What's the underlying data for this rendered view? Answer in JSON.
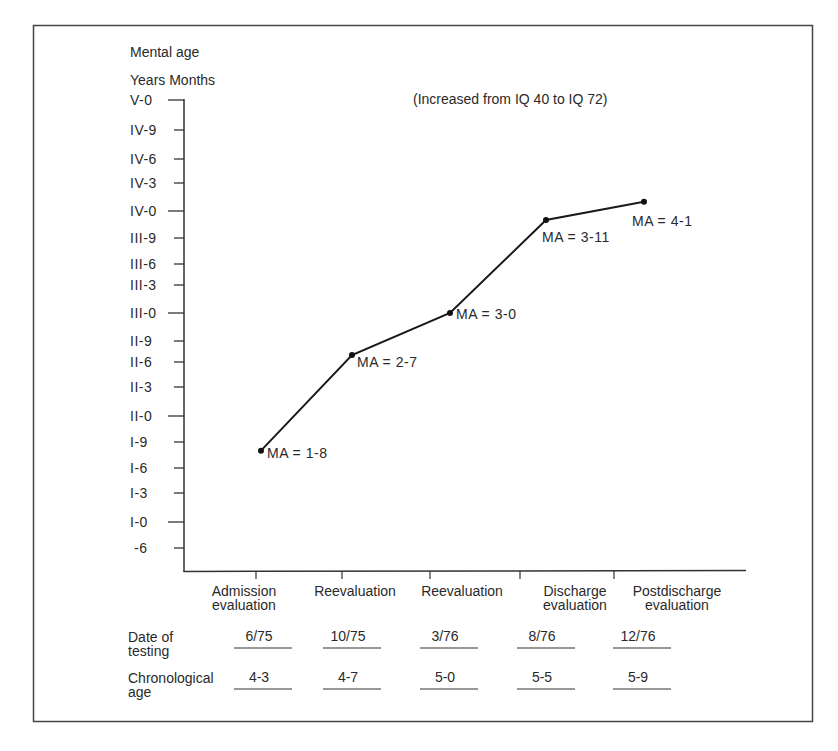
{
  "chart_data": {
    "type": "line",
    "title": "Mental age",
    "subtitle": "Years Months",
    "annotation": "(Increased from IQ 40 to IQ 72)",
    "ylabel": "Mental age (Years-Months)",
    "xlabel": "",
    "y_unit": "months",
    "ylim": [
      6,
      60
    ],
    "y_ticks": [
      {
        "label": "V-0",
        "value": 60
      },
      {
        "label": "IV-9",
        "value": 57
      },
      {
        "label": "IV-6",
        "value": 54
      },
      {
        "label": "IV-3",
        "value": 51
      },
      {
        "label": "IV-0",
        "value": 48
      },
      {
        "label": "III-9",
        "value": 45
      },
      {
        "label": "III-6",
        "value": 42
      },
      {
        "label": "III-3",
        "value": 39
      },
      {
        "label": "III-0",
        "value": 36
      },
      {
        "label": "II-9",
        "value": 33
      },
      {
        "label": "II-6",
        "value": 30
      },
      {
        "label": "II-3",
        "value": 27
      },
      {
        "label": "II-0",
        "value": 24
      },
      {
        "label": "I-9",
        "value": 21
      },
      {
        "label": "I-6",
        "value": 18
      },
      {
        "label": "I-3",
        "value": 15
      },
      {
        "label": "I-0",
        "value": 12
      },
      {
        "label": "-6",
        "value": 6
      }
    ],
    "categories": [
      [
        "Admission",
        "evaluation"
      ],
      [
        "Reevaluation"
      ],
      [
        "Reevaluation"
      ],
      [
        "Discharge",
        "evaluation"
      ],
      [
        "Postdischarge",
        "evaluation"
      ]
    ],
    "series": [
      {
        "name": "Mental age",
        "values": [
          20,
          31,
          36,
          47,
          49
        ],
        "labels": [
          "MA = 1-8",
          "MA = 2-7",
          "MA = 3-0",
          "MA = 3-11",
          "MA = 4-1"
        ]
      }
    ],
    "grid": false,
    "table": {
      "rows": [
        {
          "label": [
            "Date of",
            "testing"
          ],
          "values": [
            "6/75",
            "10/75",
            "3/76",
            "8/76",
            "12/76"
          ]
        },
        {
          "label": [
            "Chronological",
            "age"
          ],
          "values": [
            "4-3",
            "4-7",
            "5-0",
            "5-5",
            "5-9"
          ]
        }
      ]
    }
  },
  "colors": {
    "ink": "#2a2a2a",
    "frame": "#444444",
    "background": "#ffffff"
  }
}
